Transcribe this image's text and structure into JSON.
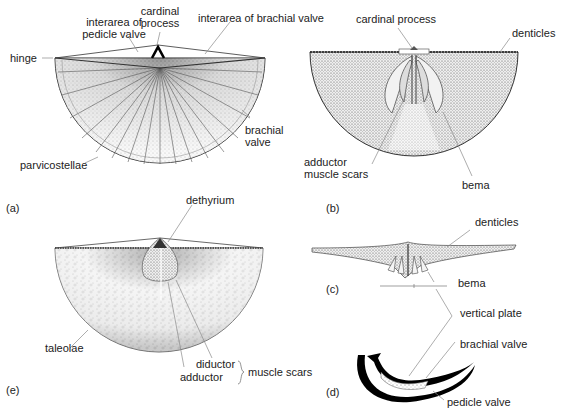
{
  "figure": {
    "panels": [
      {
        "id": "a",
        "label": "(a)",
        "annotations": {
          "interarea_pedicle": [
            "interarea of",
            "pedicle valve"
          ],
          "cardinal_process": [
            "cardinal",
            "process"
          ],
          "interarea_brachial": "interarea of brachial valve",
          "hinge": "hinge",
          "brachial_valve": [
            "brachial",
            "valve"
          ],
          "parvicostellae": "parvicostellae"
        }
      },
      {
        "id": "b",
        "label": "(b)",
        "annotations": {
          "cardinal_process": "cardinal process",
          "denticles": "denticles",
          "adductor_muscle_scars": [
            "adductor",
            "muscle scars"
          ],
          "bema": "bema"
        }
      },
      {
        "id": "c",
        "label": "(c)",
        "annotations": {
          "denticles": "denticles",
          "bema": "bema"
        }
      },
      {
        "id": "d",
        "label": "(d)",
        "annotations": {
          "vertical_plate": "vertical plate",
          "brachial_valve": "brachial valve",
          "pedicle_valve": "pedicle valve"
        }
      },
      {
        "id": "e",
        "label": "(e)",
        "annotations": {
          "dethyrium": "dethyrium",
          "taleolae": "taleolae",
          "diductor": "diductor",
          "adductor": "adductor",
          "muscle_scars": "muscle scars"
        }
      }
    ]
  },
  "colors": {
    "ink": "#111111",
    "leader": "#9a9a9a",
    "stipple": "#777777"
  }
}
